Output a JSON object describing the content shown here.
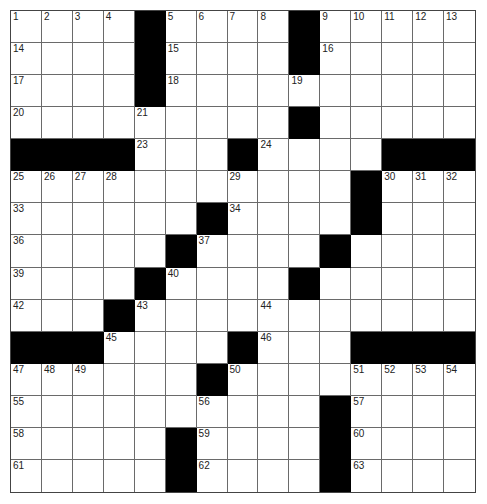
{
  "puzzle": {
    "size": {
      "rows": 15,
      "cols": 15
    },
    "colors": {
      "block": "#000000",
      "cell": "#ffffff",
      "line": "#6a6a6a"
    },
    "layout": [
      "....#....#.....",
      "....#....#.....",
      "....#..........",
      ".........#.....",
      "####...#....###",
      "...........#...",
      "......#....#...",
      ".....#....#....",
      "....#....#.....",
      "...#...........",
      "###....#...####",
      "......#........",
      "..........#....",
      ".....#....#....",
      ".....#....#...."
    ],
    "numbers": [
      {
        "r": 0,
        "c": 0,
        "n": "1"
      },
      {
        "r": 0,
        "c": 1,
        "n": "2"
      },
      {
        "r": 0,
        "c": 2,
        "n": "3"
      },
      {
        "r": 0,
        "c": 3,
        "n": "4"
      },
      {
        "r": 0,
        "c": 5,
        "n": "5"
      },
      {
        "r": 0,
        "c": 6,
        "n": "6"
      },
      {
        "r": 0,
        "c": 7,
        "n": "7"
      },
      {
        "r": 0,
        "c": 8,
        "n": "8"
      },
      {
        "r": 0,
        "c": 10,
        "n": "9"
      },
      {
        "r": 0,
        "c": 11,
        "n": "10"
      },
      {
        "r": 0,
        "c": 12,
        "n": "11"
      },
      {
        "r": 0,
        "c": 13,
        "n": "12"
      },
      {
        "r": 0,
        "c": 14,
        "n": "13"
      },
      {
        "r": 1,
        "c": 0,
        "n": "14"
      },
      {
        "r": 1,
        "c": 5,
        "n": "15"
      },
      {
        "r": 1,
        "c": 10,
        "n": "16"
      },
      {
        "r": 2,
        "c": 0,
        "n": "17"
      },
      {
        "r": 2,
        "c": 5,
        "n": "18"
      },
      {
        "r": 2,
        "c": 9,
        "n": "19"
      },
      {
        "r": 3,
        "c": 0,
        "n": "20"
      },
      {
        "r": 3,
        "c": 4,
        "n": "21"
      },
      {
        "r": 3,
        "c": 9,
        "n": "22"
      },
      {
        "r": 4,
        "c": 4,
        "n": "23"
      },
      {
        "r": 4,
        "c": 8,
        "n": "24"
      },
      {
        "r": 5,
        "c": 0,
        "n": "25"
      },
      {
        "r": 5,
        "c": 1,
        "n": "26"
      },
      {
        "r": 5,
        "c": 2,
        "n": "27"
      },
      {
        "r": 5,
        "c": 3,
        "n": "28"
      },
      {
        "r": 5,
        "c": 7,
        "n": "29"
      },
      {
        "r": 5,
        "c": 12,
        "n": "30"
      },
      {
        "r": 5,
        "c": 13,
        "n": "31"
      },
      {
        "r": 5,
        "c": 14,
        "n": "32"
      },
      {
        "r": 6,
        "c": 0,
        "n": "33"
      },
      {
        "r": 6,
        "c": 7,
        "n": "34"
      },
      {
        "r": 6,
        "c": 11,
        "n": "35"
      },
      {
        "r": 7,
        "c": 0,
        "n": "36"
      },
      {
        "r": 7,
        "c": 6,
        "n": "37"
      },
      {
        "r": 7,
        "c": 10,
        "n": "38"
      },
      {
        "r": 8,
        "c": 0,
        "n": "39"
      },
      {
        "r": 8,
        "c": 5,
        "n": "40"
      },
      {
        "r": 8,
        "c": 9,
        "n": "41"
      },
      {
        "r": 9,
        "c": 0,
        "n": "42"
      },
      {
        "r": 9,
        "c": 4,
        "n": "43"
      },
      {
        "r": 9,
        "c": 8,
        "n": "44"
      },
      {
        "r": 10,
        "c": 3,
        "n": "45"
      },
      {
        "r": 10,
        "c": 8,
        "n": "46"
      },
      {
        "r": 11,
        "c": 0,
        "n": "47"
      },
      {
        "r": 11,
        "c": 1,
        "n": "48"
      },
      {
        "r": 11,
        "c": 2,
        "n": "49"
      },
      {
        "r": 11,
        "c": 7,
        "n": "50"
      },
      {
        "r": 11,
        "c": 11,
        "n": "51"
      },
      {
        "r": 11,
        "c": 12,
        "n": "52"
      },
      {
        "r": 11,
        "c": 13,
        "n": "53"
      },
      {
        "r": 11,
        "c": 14,
        "n": "54"
      },
      {
        "r": 12,
        "c": 0,
        "n": "55"
      },
      {
        "r": 12,
        "c": 6,
        "n": "56"
      },
      {
        "r": 12,
        "c": 11,
        "n": "57"
      },
      {
        "r": 13,
        "c": 0,
        "n": "58"
      },
      {
        "r": 13,
        "c": 6,
        "n": "59"
      },
      {
        "r": 13,
        "c": 11,
        "n": "60"
      },
      {
        "r": 14,
        "c": 0,
        "n": "61"
      },
      {
        "r": 14,
        "c": 6,
        "n": "62"
      },
      {
        "r": 14,
        "c": 11,
        "n": "63"
      }
    ]
  }
}
